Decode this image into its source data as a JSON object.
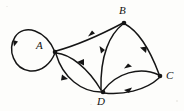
{
  "figure": {
    "kind": "directed-graph-diagram",
    "width": 184,
    "height": 111,
    "background_color": "#fdfdfb",
    "ink_color": "#151515"
  },
  "vertices": [
    {
      "id": "A",
      "label": "A",
      "dot_x": 55,
      "dot_y": 52,
      "label_x": 36,
      "label_y": 40
    },
    {
      "id": "B",
      "label": "B",
      "dot_x": 124,
      "dot_y": 23,
      "label_x": 119,
      "label_y": 5
    },
    {
      "id": "C",
      "label": "C",
      "dot_x": 160,
      "dot_y": 76,
      "label_x": 166,
      "label_y": 70
    },
    {
      "id": "D",
      "label": "D",
      "dot_x": 103,
      "dot_y": 92,
      "label_x": 97,
      "label_y": 96
    }
  ],
  "edges": [
    {
      "id": "A-A",
      "from": "A",
      "to": "A",
      "style": "self-loop-left",
      "arrow_label": "down-left"
    },
    {
      "id": "A-B",
      "from": "A",
      "to": "B",
      "style": "slight-curve",
      "arrow_label": "up-right"
    },
    {
      "id": "B-D",
      "from": "B",
      "to": "D",
      "style": "curve-left",
      "arrow_label": "down"
    },
    {
      "id": "B-C",
      "from": "B",
      "to": "C",
      "style": "curve-right",
      "arrow_label": "down-right"
    },
    {
      "id": "A-D",
      "from": "A",
      "to": "D",
      "style": "upper-curve",
      "arrow_label": "down-right"
    },
    {
      "id": "D-A",
      "from": "D",
      "to": "A",
      "style": "lower-curve",
      "arrow_label": "up-left"
    },
    {
      "id": "D-C",
      "from": "D",
      "to": "C",
      "style": "upper-arc",
      "arrow_label": "right"
    },
    {
      "id": "C-D",
      "from": "C",
      "to": "D",
      "style": "lower-arc",
      "arrow_label": "left"
    }
  ],
  "counts": {
    "vertex_count": 4,
    "edge_count": 8
  }
}
